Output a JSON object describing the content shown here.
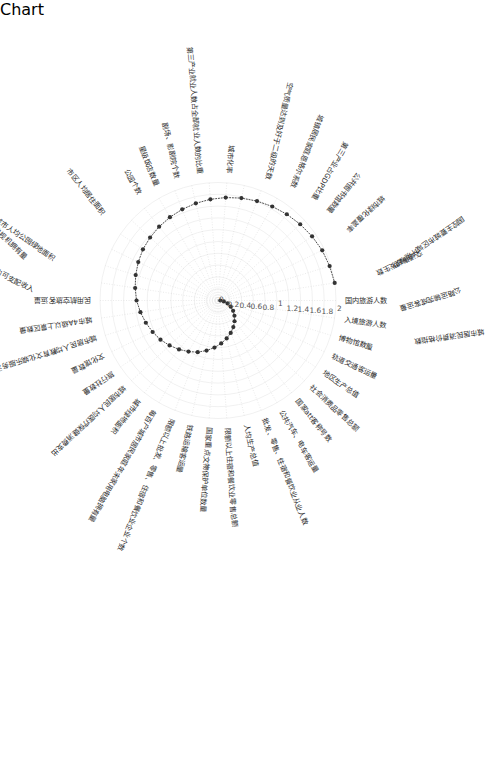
{
  "chart_data": {
    "type": "line",
    "subtype": "polar-spiral",
    "title": "",
    "xlabel": "",
    "ylabel": "",
    "grid": true,
    "legend": "none",
    "rlim": [
      0,
      2
    ],
    "rticks": [
      "0",
      "0.2",
      "0.4",
      "0.6",
      "0.8",
      "1",
      "1.2",
      "1.4",
      "1.6",
      "1.8",
      "2"
    ],
    "rtick_values": [
      0,
      0.2,
      0.4,
      0.6,
      0.8,
      1,
      1.2,
      1.4,
      1.6,
      1.8,
      2
    ],
    "categories": [
      "国内旅游人数",
      "入境旅游人数",
      "博物馆数量",
      "轨道交通客运量",
      "地区生产总值",
      "社会消费品零售总额",
      "国家att客称号数",
      "公共汽车、电车客运量",
      "批发、零售、住宿和餐饮业从业人数",
      "人均生产总值",
      "限额以上住宿和餐饮业零售总额",
      "国家重点文物保护单位数量",
      "铁路运输客运量",
      "限额以上批发、零售、住宿和餐饮业企业个数",
      "每百户城市居民家庭年末家用电脑拥有量",
      "城市绿地面积",
      "城市居民人均医疗保健消费支出",
      "旅行社数量",
      "文化馆数量",
      "城市居民人均教育文化娱乐服务消费支出",
      "城市4A级以上景区数量",
      "民用航空旅客运量",
      "城市居民人均生活用品及服务消费支出",
      "城市居民家庭人均交通通信消费支出",
      "城市居民人均可支配收入",
      "城市人均公园绿地面积",
      "每百户城市居民家庭年末彩色电视机拥有量",
      "市区人均居住面积",
      "公园个数",
      "星级饭店数量",
      "剧场、影剧院个数",
      "第三产业就业人数占全部就业人数的比重",
      "城市化率",
      "空气质量达到及好于二级的天数",
      "城镇居民家庭恩格尔系数",
      "第三产业占GDP比重",
      "公共图书馆数量",
      "城市绿化覆盖率",
      "国控主要城市区域环境噪声",
      "交通事故发生数",
      "公路运输完成客运量",
      "城市居民消费价格指数"
    ],
    "values": [
      0.04,
      0.1,
      0.17,
      0.24,
      0.31,
      0.38,
      0.45,
      0.52,
      0.59,
      0.66,
      0.73,
      0.8,
      0.87,
      0.94,
      1.0,
      1.06,
      1.12,
      1.18,
      1.23,
      1.28,
      1.33,
      1.38,
      1.42,
      1.46,
      1.5,
      1.54,
      1.57,
      1.6,
      1.63,
      1.66,
      1.69,
      1.72,
      1.75,
      1.78,
      1.81,
      1.84,
      1.87,
      1.9,
      1.93,
      1.96,
      1.98,
      2.0
    ]
  },
  "figure": {
    "background_color": "#ffffff",
    "series_color": "#333333",
    "grid_color": "#e0e0e0",
    "orientation": "rotated-90"
  }
}
